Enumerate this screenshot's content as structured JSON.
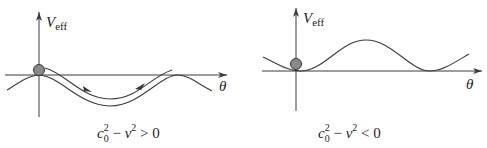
{
  "figure": {
    "panels": [
      {
        "id": "left",
        "y_axis_label": "V",
        "y_axis_label_sub": "eff",
        "x_axis_label": "θ",
        "caption": {
          "c": "c",
          "c_sup": "2",
          "c_sub": "0",
          "minus": " − ",
          "v": "v",
          "v_sup": "2",
          "relation": " > 0"
        },
        "description": "potential well with particle oscillating",
        "particle": "ball",
        "trajectory_arrows": 2
      },
      {
        "id": "right",
        "y_axis_label": "V",
        "y_axis_label_sub": "eff",
        "x_axis_label": "θ",
        "caption": {
          "c": "c",
          "c_sup": "2",
          "c_sub": "0",
          "minus": " − ",
          "v": "v",
          "v_sup": "2",
          "relation": " < 0"
        },
        "description": "potential hill with particle at minimum",
        "particle": "ball"
      }
    ],
    "colors": {
      "line": "#3a3a3a",
      "ball_fill": "#8a8a8a",
      "ball_stroke": "#333333"
    }
  }
}
